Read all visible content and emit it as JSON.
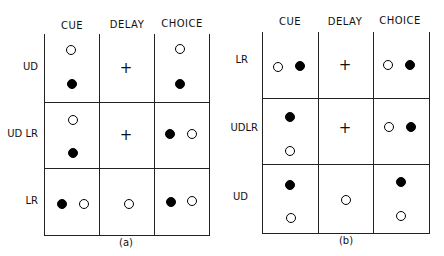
{
  "panels": {
    "a": {
      "caption": "(a)",
      "columns": [
        "CUE",
        "DELAY",
        "CHOICE"
      ],
      "rows": [
        {
          "label": "UD",
          "cue": [
            "open-top",
            "filled-bottom"
          ],
          "delay": "+",
          "choice": [
            "open-top",
            "filled-bottom"
          ]
        },
        {
          "label": "UD LR",
          "cue": [
            "open-top",
            "filled-bottom"
          ],
          "delay": "+",
          "choice": [
            "filled-left",
            "open-right"
          ]
        },
        {
          "label": "LR",
          "cue": [
            "filled-left",
            "open-right"
          ],
          "delay": "open-center",
          "choice": [
            "filled-left",
            "open-right"
          ]
        }
      ]
    },
    "b": {
      "caption": "(b)",
      "columns": [
        "CUE",
        "DELAY",
        "CHOICE"
      ],
      "rows": [
        {
          "label": "LR",
          "cue": [
            "open-left",
            "filled-right"
          ],
          "delay": "+",
          "choice": [
            "open-left",
            "filled-right"
          ]
        },
        {
          "label": "UDLR",
          "cue": [
            "filled-top",
            "open-bottom"
          ],
          "delay": "+",
          "choice": [
            "open-left",
            "filled-right"
          ]
        },
        {
          "label": "UD",
          "cue": [
            "filled-top",
            "open-bottom"
          ],
          "delay": "open-center",
          "choice": [
            "filled-top",
            "open-bottom"
          ]
        }
      ]
    }
  },
  "symbols": {
    "plus": "+"
  }
}
